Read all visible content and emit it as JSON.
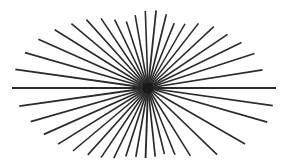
{
  "figure": {
    "canvas": {
      "width": 296,
      "height": 167,
      "background_color": "#ffffff"
    },
    "center": {
      "x": 148,
      "y": 88,
      "label": "convergence-point"
    },
    "style": {
      "line_color": "#2b2b2b",
      "core_color": "#1a1a1a",
      "stroke_width": 1.6,
      "ray_count": 40
    },
    "rays": [
      {
        "angle_deg": 0,
        "length": 128,
        "stroke_width": 2.0
      },
      {
        "angle_deg": 9,
        "length": 116,
        "stroke_width": 1.7
      },
      {
        "angle_deg": 18,
        "length": 112,
        "stroke_width": 1.6
      },
      {
        "angle_deg": 26,
        "length": 104,
        "stroke_width": 1.6
      },
      {
        "angle_deg": 34,
        "length": 96,
        "stroke_width": 1.6
      },
      {
        "angle_deg": 43,
        "length": 90,
        "stroke_width": 1.5
      },
      {
        "angle_deg": 52,
        "length": 82,
        "stroke_width": 1.6
      },
      {
        "angle_deg": 60,
        "length": 74,
        "stroke_width": 1.5
      },
      {
        "angle_deg": 68,
        "length": 70,
        "stroke_width": 1.6
      },
      {
        "angle_deg": 76,
        "length": 76,
        "stroke_width": 1.7
      },
      {
        "angle_deg": 84,
        "length": 78,
        "stroke_width": 1.8
      },
      {
        "angle_deg": 92,
        "length": 77,
        "stroke_width": 1.6
      },
      {
        "angle_deg": 100,
        "length": 74,
        "stroke_width": 1.6
      },
      {
        "angle_deg": 108,
        "length": 70,
        "stroke_width": 1.6
      },
      {
        "angle_deg": 116,
        "length": 76,
        "stroke_width": 1.6
      },
      {
        "angle_deg": 124,
        "length": 84,
        "stroke_width": 1.6
      },
      {
        "angle_deg": 132,
        "length": 92,
        "stroke_width": 1.6
      },
      {
        "angle_deg": 140,
        "length": 100,
        "stroke_width": 1.6
      },
      {
        "angle_deg": 148,
        "length": 110,
        "stroke_width": 1.6
      },
      {
        "angle_deg": 156,
        "length": 120,
        "stroke_width": 1.7
      },
      {
        "angle_deg": 164,
        "length": 128,
        "stroke_width": 1.8
      },
      {
        "angle_deg": 172,
        "length": 134,
        "stroke_width": 1.9
      },
      {
        "angle_deg": 180,
        "length": 136,
        "stroke_width": 2.2
      },
      {
        "angle_deg": 188,
        "length": 130,
        "stroke_width": 1.9
      },
      {
        "angle_deg": 196,
        "length": 122,
        "stroke_width": 1.7
      },
      {
        "angle_deg": 204,
        "length": 114,
        "stroke_width": 1.7
      },
      {
        "angle_deg": 212,
        "length": 106,
        "stroke_width": 1.6
      },
      {
        "angle_deg": 220,
        "length": 98,
        "stroke_width": 1.6
      },
      {
        "angle_deg": 228,
        "length": 90,
        "stroke_width": 1.6
      },
      {
        "angle_deg": 236,
        "length": 84,
        "stroke_width": 1.6
      },
      {
        "angle_deg": 244,
        "length": 78,
        "stroke_width": 1.6
      },
      {
        "angle_deg": 252,
        "length": 72,
        "stroke_width": 1.7
      },
      {
        "angle_deg": 260,
        "length": 70,
        "stroke_width": 1.7
      },
      {
        "angle_deg": 268,
        "length": 70,
        "stroke_width": 1.9
      },
      {
        "angle_deg": 276,
        "length": 69,
        "stroke_width": 1.7
      },
      {
        "angle_deg": 284,
        "length": 68,
        "stroke_width": 1.6
      },
      {
        "angle_deg": 292,
        "length": 72,
        "stroke_width": 1.6
      },
      {
        "angle_deg": 302,
        "length": 80,
        "stroke_width": 1.6
      },
      {
        "angle_deg": 316,
        "length": 96,
        "stroke_width": 1.6
      },
      {
        "angle_deg": 330,
        "length": 112,
        "stroke_width": 1.6
      },
      {
        "angle_deg": 344,
        "length": 124,
        "stroke_width": 1.7
      },
      {
        "angle_deg": 352,
        "length": 126,
        "stroke_width": 1.7
      }
    ]
  }
}
